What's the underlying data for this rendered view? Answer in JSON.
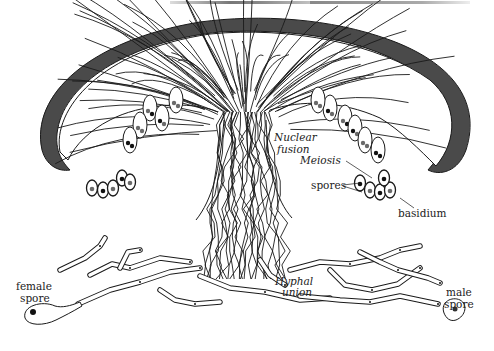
{
  "figure": {
    "colors": {
      "outline": "#1a1a1a",
      "cap_rim": "#4a4a4a",
      "nucleus_dark": "#111111",
      "nucleus_gray": "#6a6a6a",
      "background": "#ffffff"
    },
    "labels": {
      "nuclear_fusion_line1": "Nuclear",
      "nuclear_fusion_line2": "fusion",
      "meiosis": "Meiosis",
      "spores": "spores",
      "basidium": "basidium",
      "hyphal_union_line1": "Hyphal",
      "hyphal_union_line2": "union",
      "female_spore_line1": "female",
      "female_spore_line2": "spore",
      "male_spore_line1": "male",
      "male_spore_line2": "spore"
    }
  }
}
